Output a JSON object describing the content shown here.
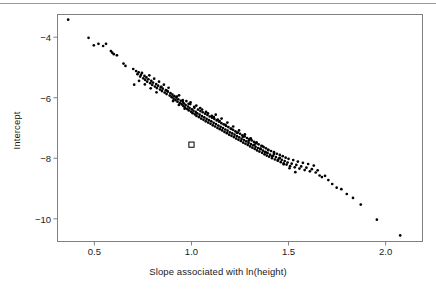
{
  "figure": {
    "background_color": "#ffffff",
    "rule_color": "#9a9a9a",
    "point_color": "#000000",
    "frame_color": "#808080"
  },
  "chart_data": {
    "type": "scatter",
    "title": "",
    "xlabel": "Slope associated with ln(height)",
    "ylabel": "Intercept",
    "xlim": [
      0.31,
      2.19
    ],
    "ylim": [
      -10.75,
      -3.25
    ],
    "xticks": [
      0.5,
      1.0,
      1.5,
      2.0
    ],
    "xticklabels": [
      "0.5",
      "1.0",
      "1.5",
      "2.0"
    ],
    "yticks": [
      -4,
      -6,
      -8,
      -10
    ],
    "yticklabels": [
      "−4",
      "−6",
      "−8",
      "−10"
    ],
    "grid": false,
    "legend": null,
    "series": [
      {
        "name": "bootstrap-estimates",
        "marker": "filled-circle",
        "color": "#000000",
        "points": [
          [
            0.365,
            -3.42
          ],
          [
            0.47,
            -4.02
          ],
          [
            0.497,
            -4.27
          ],
          [
            0.521,
            -4.22
          ],
          [
            0.545,
            -4.29
          ],
          [
            0.56,
            -4.22
          ],
          [
            0.585,
            -4.46
          ],
          [
            0.592,
            -4.51
          ],
          [
            0.6,
            -4.56
          ],
          [
            0.616,
            -4.6
          ],
          [
            0.65,
            -4.87
          ],
          [
            0.66,
            -4.95
          ],
          [
            0.7,
            -5.05
          ],
          [
            0.705,
            -5.57
          ],
          [
            0.715,
            -5.12
          ],
          [
            0.722,
            -5.22
          ],
          [
            0.728,
            -5.16
          ],
          [
            0.736,
            -5.3
          ],
          [
            0.74,
            -5.24
          ],
          [
            0.745,
            -5.18
          ],
          [
            0.752,
            -5.36
          ],
          [
            0.758,
            -5.28
          ],
          [
            0.762,
            -5.41
          ],
          [
            0.768,
            -5.33
          ],
          [
            0.772,
            -5.47
          ],
          [
            0.778,
            -5.39
          ],
          [
            0.783,
            -5.26
          ],
          [
            0.788,
            -5.52
          ],
          [
            0.793,
            -5.44
          ],
          [
            0.798,
            -5.58
          ],
          [
            0.802,
            -5.5
          ],
          [
            0.808,
            -5.37
          ],
          [
            0.812,
            -5.63
          ],
          [
            0.818,
            -5.55
          ],
          [
            0.822,
            -5.68
          ],
          [
            0.828,
            -5.6
          ],
          [
            0.833,
            -5.47
          ],
          [
            0.838,
            -5.73
          ],
          [
            0.842,
            -5.65
          ],
          [
            0.848,
            -5.78
          ],
          [
            0.852,
            -5.7
          ],
          [
            0.858,
            -5.57
          ],
          [
            0.862,
            -5.83
          ],
          [
            0.868,
            -5.75
          ],
          [
            0.872,
            -5.88
          ],
          [
            0.878,
            -5.8
          ],
          [
            0.882,
            -5.67
          ],
          [
            0.888,
            -5.93
          ],
          [
            0.892,
            -5.85
          ],
          [
            0.898,
            -5.98
          ],
          [
            0.902,
            -5.9
          ],
          [
            0.908,
            -6.03
          ],
          [
            0.912,
            -5.95
          ],
          [
            0.918,
            -6.08
          ],
          [
            0.922,
            -6.0
          ],
          [
            0.928,
            -6.13
          ],
          [
            0.932,
            -6.05
          ],
          [
            0.936,
            -5.92
          ],
          [
            0.94,
            -6.18
          ],
          [
            0.945,
            -6.1
          ],
          [
            0.95,
            -6.22
          ],
          [
            0.955,
            -6.14
          ],
          [
            0.958,
            -6.27
          ],
          [
            0.962,
            -6.19
          ],
          [
            0.966,
            -6.32
          ],
          [
            0.97,
            -6.24
          ],
          [
            0.974,
            -6.11
          ],
          [
            0.978,
            -6.37
          ],
          [
            0.982,
            -6.29
          ],
          [
            0.986,
            -6.42
          ],
          [
            0.99,
            -6.34
          ],
          [
            0.994,
            -6.21
          ],
          [
            0.998,
            -6.46
          ],
          [
            1.002,
            -6.38
          ],
          [
            1.006,
            -6.51
          ],
          [
            1.01,
            -6.43
          ],
          [
            1.014,
            -6.3
          ],
          [
            1.018,
            -6.55
          ],
          [
            1.022,
            -6.47
          ],
          [
            1.026,
            -6.6
          ],
          [
            1.03,
            -6.52
          ],
          [
            1.034,
            -6.39
          ],
          [
            1.038,
            -6.64
          ],
          [
            1.042,
            -6.56
          ],
          [
            1.046,
            -6.44
          ],
          [
            1.05,
            -6.69
          ],
          [
            1.054,
            -6.61
          ],
          [
            1.058,
            -6.48
          ],
          [
            1.062,
            -6.73
          ],
          [
            1.066,
            -6.65
          ],
          [
            1.07,
            -6.53
          ],
          [
            1.074,
            -6.78
          ],
          [
            1.078,
            -6.7
          ],
          [
            1.082,
            -6.57
          ],
          [
            1.086,
            -6.82
          ],
          [
            1.09,
            -6.74
          ],
          [
            1.094,
            -6.62
          ],
          [
            1.098,
            -6.86
          ],
          [
            1.102,
            -6.78
          ],
          [
            1.106,
            -6.66
          ],
          [
            1.11,
            -6.91
          ],
          [
            1.114,
            -6.83
          ],
          [
            1.118,
            -6.7
          ],
          [
            1.122,
            -6.95
          ],
          [
            1.126,
            -6.87
          ],
          [
            1.13,
            -6.75
          ],
          [
            1.134,
            -7.0
          ],
          [
            1.138,
            -6.92
          ],
          [
            1.142,
            -6.79
          ],
          [
            1.146,
            -7.04
          ],
          [
            1.15,
            -6.96
          ],
          [
            1.154,
            -6.84
          ],
          [
            1.158,
            -7.08
          ],
          [
            1.162,
            -7.0
          ],
          [
            1.166,
            -6.88
          ],
          [
            1.17,
            -7.13
          ],
          [
            1.174,
            -7.05
          ],
          [
            1.178,
            -6.93
          ],
          [
            1.182,
            -7.17
          ],
          [
            1.186,
            -7.09
          ],
          [
            1.19,
            -6.97
          ],
          [
            1.194,
            -7.22
          ],
          [
            1.198,
            -7.14
          ],
          [
            1.202,
            -7.02
          ],
          [
            1.206,
            -7.26
          ],
          [
            1.21,
            -7.18
          ],
          [
            1.214,
            -7.06
          ],
          [
            1.218,
            -7.3
          ],
          [
            1.222,
            -7.22
          ],
          [
            1.226,
            -7.11
          ],
          [
            1.23,
            -7.35
          ],
          [
            1.234,
            -7.27
          ],
          [
            1.238,
            -7.15
          ],
          [
            1.242,
            -7.39
          ],
          [
            1.246,
            -7.31
          ],
          [
            1.25,
            -7.19
          ],
          [
            1.254,
            -7.43
          ],
          [
            1.258,
            -7.36
          ],
          [
            1.262,
            -7.24
          ],
          [
            1.266,
            -7.48
          ],
          [
            1.27,
            -7.4
          ],
          [
            1.274,
            -7.28
          ],
          [
            1.278,
            -7.52
          ],
          [
            1.282,
            -7.44
          ],
          [
            1.286,
            -7.33
          ],
          [
            1.29,
            -7.56
          ],
          [
            1.294,
            -7.49
          ],
          [
            1.298,
            -7.37
          ],
          [
            1.302,
            -7.61
          ],
          [
            1.306,
            -7.53
          ],
          [
            1.31,
            -7.41
          ],
          [
            1.314,
            -7.65
          ],
          [
            1.318,
            -7.57
          ],
          [
            1.322,
            -7.46
          ],
          [
            1.326,
            -7.69
          ],
          [
            1.33,
            -7.62
          ],
          [
            1.334,
            -7.5
          ],
          [
            1.338,
            -7.74
          ],
          [
            1.342,
            -7.66
          ],
          [
            1.346,
            -7.54
          ],
          [
            1.35,
            -7.78
          ],
          [
            1.356,
            -7.7
          ],
          [
            1.36,
            -7.59
          ],
          [
            1.364,
            -7.82
          ],
          [
            1.368,
            -7.75
          ],
          [
            1.372,
            -7.63
          ],
          [
            1.376,
            -7.87
          ],
          [
            1.38,
            -7.79
          ],
          [
            1.384,
            -7.67
          ],
          [
            1.388,
            -7.91
          ],
          [
            1.392,
            -7.83
          ],
          [
            1.396,
            -7.72
          ],
          [
            1.4,
            -7.95
          ],
          [
            1.405,
            -7.88
          ],
          [
            1.41,
            -7.76
          ],
          [
            1.415,
            -8.0
          ],
          [
            1.42,
            -7.92
          ],
          [
            1.425,
            -7.8
          ],
          [
            1.43,
            -8.04
          ],
          [
            1.435,
            -7.96
          ],
          [
            1.44,
            -7.85
          ],
          [
            1.445,
            -8.08
          ],
          [
            1.45,
            -8.01
          ],
          [
            1.455,
            -7.89
          ],
          [
            1.46,
            -8.13
          ],
          [
            1.465,
            -8.05
          ],
          [
            1.47,
            -7.93
          ],
          [
            1.475,
            -8.17
          ],
          [
            1.48,
            -8.09
          ],
          [
            1.485,
            -7.98
          ],
          [
            1.49,
            -8.21
          ],
          [
            1.495,
            -8.14
          ],
          [
            1.5,
            -8.02
          ],
          [
            1.508,
            -8.26
          ],
          [
            1.516,
            -8.18
          ],
          [
            1.524,
            -8.06
          ],
          [
            1.532,
            -8.3
          ],
          [
            1.54,
            -8.22
          ],
          [
            1.548,
            -8.11
          ],
          [
            1.556,
            -8.34
          ],
          [
            1.565,
            -8.27
          ],
          [
            1.574,
            -8.15
          ],
          [
            1.583,
            -8.39
          ],
          [
            1.592,
            -8.31
          ],
          [
            1.601,
            -8.19
          ],
          [
            1.61,
            -8.43
          ],
          [
            1.62,
            -8.36
          ],
          [
            1.63,
            -8.24
          ],
          [
            1.64,
            -8.47
          ],
          [
            1.65,
            -8.4
          ],
          [
            1.66,
            -8.57
          ],
          [
            1.672,
            -8.62
          ],
          [
            1.688,
            -8.58
          ],
          [
            1.705,
            -8.72
          ],
          [
            1.725,
            -8.85
          ],
          [
            1.748,
            -8.97
          ],
          [
            1.772,
            -9.02
          ],
          [
            1.8,
            -9.18
          ],
          [
            1.832,
            -9.31
          ],
          [
            1.872,
            -9.53
          ],
          [
            1.955,
            -10.03
          ],
          [
            2.075,
            -10.55
          ],
          [
            0.905,
            -6.11
          ],
          [
            0.935,
            -6.24
          ],
          [
            0.965,
            -6.36
          ],
          [
            0.995,
            -6.15
          ],
          [
            1.025,
            -6.26
          ],
          [
            1.055,
            -6.39
          ],
          [
            1.085,
            -6.52
          ],
          [
            1.115,
            -6.64
          ],
          [
            1.145,
            -6.77
          ],
          [
            1.175,
            -6.9
          ],
          [
            1.205,
            -7.03
          ],
          [
            1.235,
            -7.16
          ],
          [
            1.265,
            -7.29
          ],
          [
            1.295,
            -7.42
          ],
          [
            1.325,
            -7.55
          ],
          [
            1.355,
            -7.68
          ],
          [
            1.385,
            -7.81
          ],
          [
            1.415,
            -7.94
          ],
          [
            1.445,
            -8.07
          ],
          [
            1.475,
            -8.2
          ],
          [
            0.845,
            -5.64
          ],
          [
            0.875,
            -5.77
          ],
          [
            0.73,
            -5.44
          ],
          [
            0.76,
            -5.56
          ],
          [
            0.79,
            -5.69
          ],
          [
            0.82,
            -5.82
          ],
          [
            1.505,
            -8.33
          ],
          [
            1.535,
            -8.46
          ],
          [
            1.125,
            -6.56
          ],
          [
            1.155,
            -6.69
          ],
          [
            1.185,
            -6.82
          ],
          [
            1.215,
            -6.95
          ],
          [
            1.245,
            -7.08
          ],
          [
            1.275,
            -7.21
          ],
          [
            1.305,
            -7.34
          ],
          [
            1.335,
            -7.47
          ],
          [
            1.365,
            -7.6
          ],
          [
            1.395,
            -7.73
          ],
          [
            1.425,
            -7.86
          ],
          [
            1.455,
            -7.99
          ],
          [
            1.045,
            -6.34
          ],
          [
            1.075,
            -6.47
          ],
          [
            1.105,
            -6.6
          ],
          [
            1.135,
            -6.72
          ],
          [
            0.955,
            -6.08
          ],
          [
            0.985,
            -6.2
          ],
          [
            1.015,
            -6.33
          ],
          [
            0.925,
            -5.96
          ]
        ]
      },
      {
        "name": "observed-estimate",
        "marker": "open-square",
        "color": "#000000",
        "points": [
          [
            1.0,
            -7.55
          ]
        ]
      }
    ]
  }
}
